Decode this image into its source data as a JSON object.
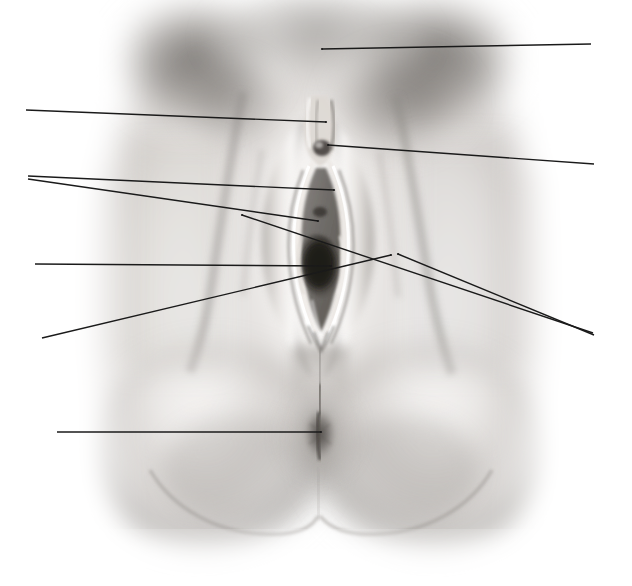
{
  "figure": {
    "domain": "anatomical-photograph",
    "description": "Grayscale anatomical photograph of the female external genitalia (vulva) in frontal view, overlaid with ten thin black leader lines radiating outward to blank label positions at the left and right margins. No label text is printed.",
    "orientation": "frontal",
    "palette": {
      "background": "#ffffff",
      "leader_line": "#1a1a1a",
      "skin_light": "#f2f0ee",
      "skin_mid": "#c9c5c1",
      "skin_shadow": "#8e8a86",
      "deep_shadow": "#4a4642",
      "darkest": "#2a2724",
      "highlight": "#fdfdfc"
    },
    "label_text_present": false,
    "leader_line_width_px": 1.4,
    "canvas": {
      "width": 632,
      "height": 586
    }
  },
  "leader_lines": [
    {
      "id": "leader-1",
      "x1": 322,
      "y1": 49,
      "x2": 591,
      "y2": 44,
      "side": "right",
      "anchor_region": "mons-pubis"
    },
    {
      "id": "leader-2",
      "x1": 26,
      "y1": 110,
      "x2": 326,
      "y2": 122,
      "side": "left",
      "anchor_region": "prepuce-clitoral-hood"
    },
    {
      "id": "leader-3",
      "x1": 328,
      "y1": 145,
      "x2": 594,
      "y2": 164,
      "side": "right",
      "anchor_region": "glans-clitoris"
    },
    {
      "id": "leader-4",
      "x1": 28,
      "y1": 176,
      "x2": 334,
      "y2": 190,
      "side": "left",
      "anchor_region": "labium-majus-upper"
    },
    {
      "id": "leader-5",
      "x1": 28,
      "y1": 179,
      "x2": 318,
      "y2": 221,
      "side": "left",
      "anchor_region": "labium-minus"
    },
    {
      "id": "leader-6",
      "x1": 35,
      "y1": 264,
      "x2": 331,
      "y2": 266,
      "side": "left",
      "anchor_region": "vaginal-orifice"
    },
    {
      "id": "leader-7",
      "x1": 242,
      "y1": 215,
      "x2": 593,
      "y2": 333,
      "side": "right",
      "anchor_region": "urethral-meatus"
    },
    {
      "id": "leader-8",
      "x1": 398,
      "y1": 254,
      "x2": 594,
      "y2": 335,
      "side": "right",
      "anchor_region": "hymenal-ring"
    },
    {
      "id": "leader-9",
      "x1": 42,
      "y1": 338,
      "x2": 391,
      "y2": 255,
      "side": "left",
      "anchor_region": "posterior-fourchette"
    },
    {
      "id": "leader-10",
      "x1": 57,
      "y1": 432,
      "x2": 321,
      "y2": 432,
      "side": "left",
      "anchor_region": "anus"
    }
  ],
  "anchor_points": [
    {
      "id": "anchor-mons-pubis",
      "x": 322,
      "y": 49
    },
    {
      "id": "anchor-prepuce",
      "x": 326,
      "y": 122
    },
    {
      "id": "anchor-glans-clitoris",
      "x": 328,
      "y": 145
    },
    {
      "id": "anchor-labium-majus",
      "x": 334,
      "y": 190
    },
    {
      "id": "anchor-labium-minus",
      "x": 318,
      "y": 221
    },
    {
      "id": "anchor-vaginal-orifice",
      "x": 331,
      "y": 266
    },
    {
      "id": "anchor-urethral-meatus",
      "x": 242,
      "y": 215
    },
    {
      "id": "anchor-hymenal-ring",
      "x": 398,
      "y": 254
    },
    {
      "id": "anchor-fourchette",
      "x": 391,
      "y": 255
    },
    {
      "id": "anchor-anus",
      "x": 321,
      "y": 432
    }
  ]
}
